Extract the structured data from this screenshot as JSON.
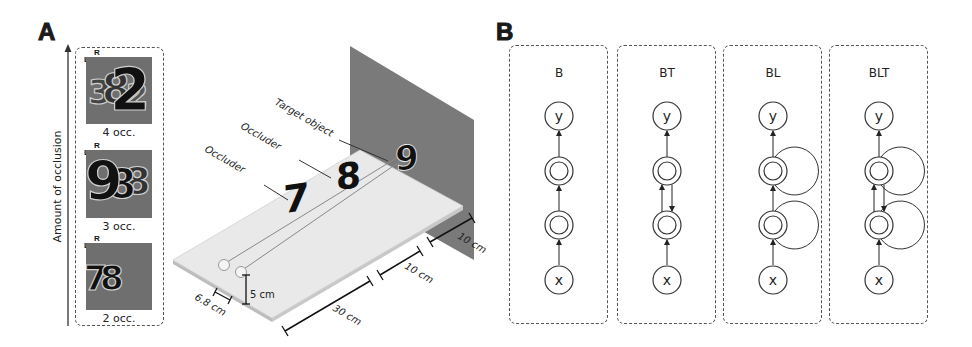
{
  "panel_a": {
    "letter": "A",
    "axis_label": "Amount of occlusion",
    "stimuli": [
      {
        "digits": "32",
        "label": "4 occ.",
        "left_marker": "L",
        "right_marker": "R"
      },
      {
        "digits": "98",
        "label": "3 occ.",
        "left_marker": "L",
        "right_marker": "R"
      },
      {
        "digits": "78",
        "label": "2 occ.",
        "left_marker": "L",
        "right_marker": "R"
      }
    ],
    "scene": {
      "labels": {
        "target": "Target object",
        "occluder_back": "Occluder",
        "occluder_front": "Occluder"
      },
      "digits": {
        "front_occluder": "7",
        "back_occluder": "8",
        "target": "9"
      },
      "dimensions": {
        "eye_separation": "6.8 cm",
        "eye_height": "5 cm",
        "eye_to_occluder": "30 cm",
        "occluder_spacing": "10 cm",
        "target_to_wall": "10 cm"
      },
      "colors": {
        "wall": "#7a7a7a",
        "platform": "#e9e9e9"
      }
    }
  },
  "panel_b": {
    "letter": "B",
    "models": [
      {
        "name": "B",
        "input": "x",
        "output": "y",
        "bottom_up": true,
        "top_down": false,
        "lateral": false
      },
      {
        "name": "BT",
        "input": "x",
        "output": "y",
        "bottom_up": true,
        "top_down": true,
        "lateral": false
      },
      {
        "name": "BL",
        "input": "x",
        "output": "y",
        "bottom_up": true,
        "top_down": false,
        "lateral": true
      },
      {
        "name": "BLT",
        "input": "x",
        "output": "y",
        "bottom_up": true,
        "top_down": true,
        "lateral": true
      }
    ]
  }
}
